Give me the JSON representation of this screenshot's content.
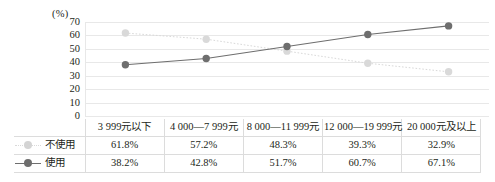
{
  "chart_data": {
    "type": "line",
    "title": "",
    "subtitle": "",
    "xlabel": "",
    "ylabel": "(%)",
    "ylim": [
      0,
      70
    ],
    "ytick_labels": [
      "70",
      "60",
      "50",
      "40",
      "30",
      "20",
      "10",
      "0"
    ],
    "ytick_values": [
      70,
      60,
      50,
      40,
      30,
      20,
      10,
      0
    ],
    "grid": true,
    "legend_position": "table-left",
    "categories": [
      "3 999元以下",
      "4 000—7 999元",
      "8 000—11 999元",
      "12 000—19 999元",
      "20 000元及以上"
    ],
    "series": [
      {
        "name": "不使用",
        "color": "#d9d9d9",
        "marker": "circle",
        "line_style": "dotted",
        "values": [
          61.8,
          57.2,
          48.3,
          39.3,
          32.9
        ],
        "labels": [
          "61.8%",
          "57.2%",
          "48.3%",
          "39.3%",
          "32.9%"
        ]
      },
      {
        "name": "使用",
        "color": "#6e6e6e",
        "marker": "circle",
        "line_style": "solid",
        "values": [
          38.2,
          42.8,
          51.7,
          60.7,
          67.1
        ],
        "labels": [
          "38.2%",
          "42.8%",
          "51.7%",
          "60.7%",
          "67.1%"
        ]
      }
    ]
  },
  "table": {
    "corner_label": "",
    "headers": [
      "3 999元以下",
      "4 000—7 999元",
      "8 000—11 999元",
      "12 000—19 999元",
      "20 000元及以上"
    ],
    "rows": [
      {
        "legend_label": "不使用",
        "marker_color": "#d4d4d4",
        "values": [
          "61.8%",
          "57.2%",
          "48.3%",
          "39.3%",
          "32.9%"
        ]
      },
      {
        "legend_label": "使用",
        "marker_color": "#6e6e6e",
        "values": [
          "38.2%",
          "42.8%",
          "51.7%",
          "60.7%",
          "67.1%"
        ]
      }
    ]
  },
  "colors": {
    "series_light": "#d9d9d9",
    "series_dark": "#6e6e6e",
    "gridline": "#e8e8e8",
    "table_border": "#dcdcdc",
    "text": "#231f20"
  }
}
